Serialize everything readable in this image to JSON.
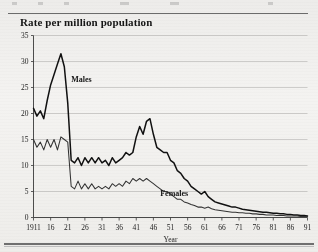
{
  "figure": {
    "title": "Rate per million population",
    "background_color": "#f1f0ee"
  },
  "chart_data": {
    "type": "line",
    "title": "Rate per million population",
    "xlabel": "Year",
    "ylabel": "",
    "xlim": [
      1911,
      1991
    ],
    "ylim": [
      0,
      35
    ],
    "yticks": [
      0,
      5,
      10,
      15,
      20,
      25,
      30,
      35
    ],
    "xticks": [
      1911,
      1916,
      1921,
      1926,
      1931,
      1936,
      1941,
      1946,
      1951,
      1956,
      1961,
      1966,
      1971,
      1976,
      1981,
      1986,
      1991
    ],
    "xtick_labels": [
      "1911",
      "16",
      "21",
      "26",
      "31",
      "36",
      "41",
      "46",
      "51",
      "56",
      "61",
      "66",
      "71",
      "76",
      "81",
      "86",
      "91"
    ],
    "grid": true,
    "grid_axis": "y",
    "legend": "inline-annotations",
    "annotations": [
      {
        "text": "Males",
        "year": 1922,
        "value": 26.0
      },
      {
        "text": "Females",
        "year": 1948,
        "value": 4.2
      }
    ],
    "series": [
      {
        "name": "Males",
        "color": "#111111",
        "x": [
          1911,
          1912,
          1913,
          1914,
          1915,
          1916,
          1917,
          1918,
          1919,
          1920,
          1921,
          1922,
          1923,
          1924,
          1925,
          1926,
          1927,
          1928,
          1929,
          1930,
          1931,
          1932,
          1933,
          1934,
          1935,
          1936,
          1937,
          1938,
          1939,
          1940,
          1941,
          1942,
          1943,
          1944,
          1945,
          1946,
          1947,
          1948,
          1949,
          1950,
          1951,
          1952,
          1953,
          1954,
          1955,
          1956,
          1957,
          1958,
          1959,
          1960,
          1961,
          1962,
          1963,
          1964,
          1965,
          1966,
          1967,
          1968,
          1969,
          1970,
          1971,
          1972,
          1973,
          1974,
          1975,
          1976,
          1977,
          1978,
          1979,
          1980,
          1981,
          1982,
          1983,
          1984,
          1985,
          1986,
          1987,
          1988,
          1989,
          1990,
          1991
        ],
        "values": [
          21.0,
          19.5,
          20.5,
          19.0,
          22.5,
          25.5,
          27.5,
          29.5,
          31.5,
          29.0,
          22.0,
          11.0,
          10.5,
          11.5,
          10.0,
          11.5,
          10.5,
          11.5,
          10.5,
          11.5,
          10.5,
          11.0,
          10.0,
          11.5,
          10.5,
          11.0,
          11.5,
          12.5,
          12.0,
          12.5,
          15.5,
          17.5,
          16.0,
          18.5,
          19.0,
          16.0,
          13.5,
          13.0,
          12.5,
          12.5,
          11.0,
          10.5,
          9.0,
          8.5,
          7.5,
          7.0,
          6.0,
          5.5,
          5.0,
          4.5,
          5.0,
          4.0,
          3.5,
          3.0,
          2.8,
          2.6,
          2.4,
          2.2,
          2.0,
          2.0,
          1.8,
          1.6,
          1.5,
          1.4,
          1.3,
          1.2,
          1.1,
          1.0,
          1.0,
          0.9,
          0.8,
          0.8,
          0.7,
          0.7,
          0.6,
          0.6,
          0.5,
          0.5,
          0.4,
          0.4,
          0.3
        ]
      },
      {
        "name": "Females",
        "color": "#333333",
        "x": [
          1911,
          1912,
          1913,
          1914,
          1915,
          1916,
          1917,
          1918,
          1919,
          1920,
          1921,
          1922,
          1923,
          1924,
          1925,
          1926,
          1927,
          1928,
          1929,
          1930,
          1931,
          1932,
          1933,
          1934,
          1935,
          1936,
          1937,
          1938,
          1939,
          1940,
          1941,
          1942,
          1943,
          1944,
          1945,
          1946,
          1947,
          1948,
          1949,
          1950,
          1951,
          1952,
          1953,
          1954,
          1955,
          1956,
          1957,
          1958,
          1959,
          1960,
          1961,
          1962,
          1963,
          1964,
          1965,
          1966,
          1967,
          1968,
          1969,
          1970,
          1971,
          1972,
          1973,
          1974,
          1975,
          1976,
          1977,
          1978,
          1979,
          1980,
          1981,
          1982,
          1983,
          1984,
          1985,
          1986,
          1987,
          1988,
          1989,
          1990,
          1991
        ],
        "values": [
          15.0,
          13.5,
          14.5,
          13.0,
          15.0,
          13.5,
          15.0,
          13.0,
          15.5,
          15.0,
          14.5,
          6.0,
          5.5,
          7.0,
          5.5,
          6.5,
          5.5,
          6.5,
          5.5,
          6.0,
          5.5,
          6.0,
          5.5,
          6.5,
          6.0,
          6.5,
          6.0,
          7.0,
          6.5,
          7.5,
          7.0,
          7.5,
          7.0,
          7.5,
          7.0,
          6.5,
          6.0,
          5.5,
          5.0,
          5.0,
          4.5,
          4.0,
          3.5,
          3.5,
          3.0,
          2.8,
          2.5,
          2.3,
          2.0,
          2.0,
          1.8,
          2.0,
          1.7,
          1.5,
          1.4,
          1.3,
          1.2,
          1.1,
          1.0,
          1.0,
          0.9,
          0.9,
          0.8,
          0.8,
          0.7,
          0.7,
          0.6,
          0.6,
          0.5,
          0.5,
          0.5,
          0.4,
          0.4,
          0.4,
          0.3,
          0.3,
          0.3,
          0.3,
          0.2,
          0.2,
          0.2
        ]
      }
    ]
  },
  "axes": {
    "y_tick_labels": [
      "35",
      "30",
      "25",
      "20",
      "15",
      "10",
      "5",
      "0"
    ],
    "x_tick_labels": [
      "1911",
      "16",
      "21",
      "26",
      "31",
      "36",
      "41",
      "46",
      "51",
      "56",
      "61",
      "66",
      "71",
      "76",
      "81",
      "86",
      "91"
    ],
    "x_axis_title": "Year"
  },
  "labels": {
    "males": "Males",
    "females": "Females"
  }
}
